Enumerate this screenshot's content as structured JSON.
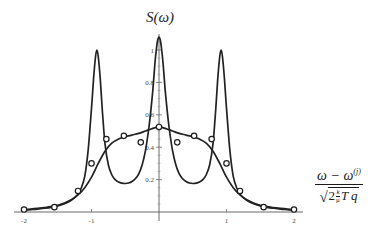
{
  "figure": {
    "title": "S(ω)",
    "title_symbol": "S",
    "title_arg": "(ω)",
    "background": "#ffffff",
    "curve_color": "#222222",
    "axis_color": "#5a5a5a",
    "marker_fill": "#ffffff",
    "marker_stroke": "#1c1c1c"
  },
  "xaxis_caption": {
    "numerator_main": "ω − ω",
    "numerator_superscript": "(j)",
    "denominator_radicand_lead": "2",
    "denominator_frac_num": "k",
    "denominator_frac_den": "μ",
    "denominator_tail": "T q",
    "radical_sign": "√"
  },
  "chart_data": {
    "type": "line",
    "title": "S(ω)",
    "xlabel": "(ω − ω^(j)) / √(2 (k/μ) T q)",
    "ylabel": "S(ω)",
    "xlim": [
      -2,
      2
    ],
    "ylim": [
      0,
      1.12
    ],
    "grid": false,
    "legend": "none",
    "xticks": [
      -2,
      -1,
      1,
      2
    ],
    "xtick_labels": [
      "-2",
      "-1",
      "1",
      "2"
    ],
    "yticks": [
      0.2,
      0.4,
      0.6,
      0.8,
      1
    ],
    "ytick_labels": [
      "0.2",
      "0.4",
      "0.6",
      "0.8",
      "1"
    ],
    "x_minor_tick_step": 0.1,
    "y_minor_tick_step": 0.05,
    "series": [
      {
        "name": "Brillouin triplet (narrow peaks)",
        "style": "solid",
        "markers": false,
        "description": "Three-peak spectrum: sharp central Rayleigh peak at 0 plus two Brillouin side peaks near ±0.92",
        "x": [
          -2.0,
          -1.9,
          -1.8,
          -1.7,
          -1.6,
          -1.5,
          -1.4,
          -1.3,
          -1.2,
          -1.15,
          -1.1,
          -1.05,
          -1.0,
          -0.97,
          -0.94,
          -0.92,
          -0.9,
          -0.87,
          -0.84,
          -0.8,
          -0.75,
          -0.7,
          -0.65,
          -0.6,
          -0.55,
          -0.5,
          -0.45,
          -0.4,
          -0.35,
          -0.3,
          -0.25,
          -0.2,
          -0.15,
          -0.12,
          -0.09,
          -0.06,
          -0.04,
          -0.02,
          0.0,
          0.02,
          0.04,
          0.06,
          0.09,
          0.12,
          0.15,
          0.2,
          0.25,
          0.3,
          0.35,
          0.4,
          0.45,
          0.5,
          0.55,
          0.6,
          0.65,
          0.7,
          0.75,
          0.8,
          0.84,
          0.87,
          0.9,
          0.92,
          0.94,
          0.97,
          1.0,
          1.05,
          1.1,
          1.15,
          1.2,
          1.3,
          1.4,
          1.5,
          1.6,
          1.7,
          1.8,
          1.9,
          2.0
        ],
        "y": [
          0.012,
          0.015,
          0.018,
          0.023,
          0.029,
          0.038,
          0.051,
          0.072,
          0.11,
          0.15,
          0.22,
          0.38,
          0.64,
          0.82,
          0.96,
          1.0,
          0.96,
          0.82,
          0.63,
          0.42,
          0.29,
          0.23,
          0.2,
          0.185,
          0.178,
          0.176,
          0.179,
          0.188,
          0.205,
          0.235,
          0.29,
          0.38,
          0.52,
          0.63,
          0.76,
          0.92,
          1.0,
          1.06,
          1.08,
          1.06,
          1.0,
          0.92,
          0.76,
          0.63,
          0.52,
          0.38,
          0.29,
          0.235,
          0.205,
          0.188,
          0.179,
          0.176,
          0.178,
          0.185,
          0.2,
          0.23,
          0.29,
          0.42,
          0.63,
          0.82,
          0.96,
          1.0,
          0.96,
          0.82,
          0.64,
          0.38,
          0.22,
          0.15,
          0.11,
          0.072,
          0.051,
          0.038,
          0.029,
          0.023,
          0.018,
          0.015,
          0.012
        ]
      },
      {
        "name": "Broad single-hump spectrum",
        "style": "solid",
        "markers": true,
        "description": "Smooth broad line shape peaking about 0.52 at zero frequency shift, with open-circle data points",
        "x": [
          -2.0,
          -1.9,
          -1.8,
          -1.7,
          -1.6,
          -1.5,
          -1.4,
          -1.3,
          -1.2,
          -1.1,
          -1.0,
          -0.9,
          -0.8,
          -0.7,
          -0.6,
          -0.5,
          -0.4,
          -0.3,
          -0.2,
          -0.1,
          0.0,
          0.1,
          0.2,
          0.3,
          0.4,
          0.5,
          0.6,
          0.7,
          0.8,
          0.9,
          1.0,
          1.1,
          1.2,
          1.3,
          1.4,
          1.5,
          1.6,
          1.7,
          1.8,
          1.9,
          2.0
        ],
        "y": [
          0.015,
          0.018,
          0.022,
          0.027,
          0.033,
          0.042,
          0.055,
          0.075,
          0.105,
          0.15,
          0.215,
          0.3,
          0.375,
          0.425,
          0.45,
          0.465,
          0.475,
          0.485,
          0.5,
          0.515,
          0.525,
          0.515,
          0.5,
          0.485,
          0.475,
          0.465,
          0.45,
          0.425,
          0.375,
          0.3,
          0.215,
          0.15,
          0.105,
          0.075,
          0.055,
          0.042,
          0.033,
          0.027,
          0.022,
          0.018,
          0.015
        ]
      }
    ],
    "data_points": {
      "name": "Open circle markers",
      "marker": "open-circle",
      "x": [
        -2.0,
        -1.55,
        -1.2,
        -1.0,
        -0.78,
        -0.52,
        -0.27,
        0.0,
        0.27,
        0.52,
        0.78,
        1.0,
        1.2,
        1.55,
        2.0
      ],
      "y": [
        0.015,
        0.03,
        0.13,
        0.3,
        0.45,
        0.47,
        0.43,
        0.525,
        0.43,
        0.47,
        0.45,
        0.3,
        0.13,
        0.03,
        0.015
      ]
    }
  }
}
